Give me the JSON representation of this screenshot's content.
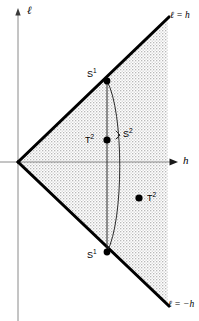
{
  "figure": {
    "axes": {
      "vertical_label": "ℓ",
      "horizontal_label": "h"
    },
    "boundary_lines": [
      {
        "name": "upper-boundary",
        "label": "ℓ = h"
      },
      {
        "name": "lower-boundary",
        "label": "ℓ = −h"
      }
    ],
    "points": [
      {
        "name": "s1-upper",
        "label": "S",
        "exponent": "1"
      },
      {
        "name": "s1-lower",
        "label": "S",
        "exponent": "1"
      },
      {
        "name": "t2-on-chord",
        "label": "T",
        "exponent": "2"
      },
      {
        "name": "t2-interior",
        "label": "T",
        "exponent": "2"
      }
    ],
    "brace": {
      "name": "s2-brace",
      "label": "S",
      "exponent": "2"
    },
    "colors": {
      "stroke": "#000000",
      "axis": "#808080",
      "shade": "#d4d4d4",
      "background": "#ffffff"
    }
  }
}
